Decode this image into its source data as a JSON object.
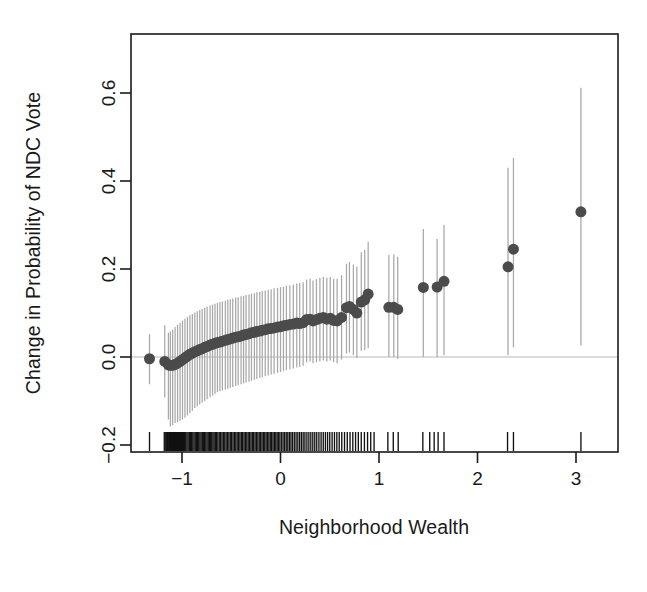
{
  "figure": {
    "background_color": "#ffffff",
    "point_color": "#4b4b4b",
    "errorbar_color": "#a8a8a8",
    "axis_color": "#1a1a1a",
    "zero_line_color": "#b9b9b9",
    "rug_color": "#111111"
  },
  "chart_data": {
    "type": "scatter",
    "title": "",
    "xlabel": "Neighborhood Wealth",
    "ylabel": "Change in Probability of NDC Vote",
    "xlim": [
      -1.5,
      3.4
    ],
    "ylim": [
      -0.28,
      0.72
    ],
    "grid": false,
    "legend": null,
    "xticks": [
      -1,
      0,
      1,
      2,
      3
    ],
    "xticklabels": [
      "−1",
      "0",
      "1",
      "2",
      "3"
    ],
    "yticks": [
      -0.2,
      0.0,
      0.2,
      0.4,
      0.6
    ],
    "yticklabels": [
      "−0.2",
      "0.0",
      "0.2",
      "0.4",
      "0.6"
    ],
    "reference_lines": [
      {
        "axis": "y",
        "value": 0.0,
        "style": "solid",
        "color": "#b9b9b9"
      }
    ],
    "annotations": [],
    "series": [
      {
        "name": "Marginal effect with 95% confidence interval",
        "marker": "filled-circle",
        "marker_size_px": 11,
        "has_errorbars": true,
        "points": [
          {
            "x": -1.33,
            "y": -0.004,
            "lo": -0.062,
            "hi": 0.052
          },
          {
            "x": -1.175,
            "y": -0.01,
            "lo": -0.092,
            "hi": 0.072
          },
          {
            "x": -1.138,
            "y": -0.018,
            "lo": -0.142,
            "hi": 0.055
          },
          {
            "x": -1.118,
            "y": -0.019,
            "lo": -0.158,
            "hi": 0.058
          },
          {
            "x": -1.095,
            "y": -0.019,
            "lo": -0.155,
            "hi": 0.062
          },
          {
            "x": -1.07,
            "y": -0.017,
            "lo": -0.15,
            "hi": 0.068
          },
          {
            "x": -1.045,
            "y": -0.014,
            "lo": -0.148,
            "hi": 0.073
          },
          {
            "x": -1.02,
            "y": -0.01,
            "lo": -0.145,
            "hi": 0.078
          },
          {
            "x": -0.995,
            "y": -0.006,
            "lo": -0.142,
            "hi": 0.083
          },
          {
            "x": -0.97,
            "y": -0.002,
            "lo": -0.138,
            "hi": 0.087
          },
          {
            "x": -0.945,
            "y": 0.002,
            "lo": -0.133,
            "hi": 0.091
          },
          {
            "x": -0.92,
            "y": 0.006,
            "lo": -0.128,
            "hi": 0.095
          },
          {
            "x": -0.895,
            "y": 0.009,
            "lo": -0.122,
            "hi": 0.098
          },
          {
            "x": -0.87,
            "y": 0.012,
            "lo": -0.116,
            "hi": 0.101
          },
          {
            "x": -0.845,
            "y": 0.014,
            "lo": -0.112,
            "hi": 0.104
          },
          {
            "x": -0.82,
            "y": 0.017,
            "lo": -0.108,
            "hi": 0.107
          },
          {
            "x": -0.795,
            "y": 0.019,
            "lo": -0.104,
            "hi": 0.109
          },
          {
            "x": -0.77,
            "y": 0.022,
            "lo": -0.1,
            "hi": 0.112
          },
          {
            "x": -0.745,
            "y": 0.024,
            "lo": -0.096,
            "hi": 0.114
          },
          {
            "x": -0.715,
            "y": 0.027,
            "lo": -0.092,
            "hi": 0.117
          },
          {
            "x": -0.69,
            "y": 0.029,
            "lo": -0.088,
            "hi": 0.119
          },
          {
            "x": -0.665,
            "y": 0.031,
            "lo": -0.084,
            "hi": 0.121
          },
          {
            "x": -0.64,
            "y": 0.033,
            "lo": -0.08,
            "hi": 0.123
          },
          {
            "x": -0.615,
            "y": 0.034,
            "lo": -0.078,
            "hi": 0.125
          },
          {
            "x": -0.59,
            "y": 0.036,
            "lo": -0.076,
            "hi": 0.126
          },
          {
            "x": -0.56,
            "y": 0.038,
            "lo": -0.074,
            "hi": 0.128
          },
          {
            "x": -0.535,
            "y": 0.04,
            "lo": -0.072,
            "hi": 0.13
          },
          {
            "x": -0.51,
            "y": 0.041,
            "lo": -0.07,
            "hi": 0.131
          },
          {
            "x": -0.485,
            "y": 0.043,
            "lo": -0.068,
            "hi": 0.133
          },
          {
            "x": -0.455,
            "y": 0.045,
            "lo": -0.066,
            "hi": 0.135
          },
          {
            "x": -0.43,
            "y": 0.046,
            "lo": -0.064,
            "hi": 0.136
          },
          {
            "x": -0.4,
            "y": 0.048,
            "lo": -0.062,
            "hi": 0.138
          },
          {
            "x": -0.375,
            "y": 0.05,
            "lo": -0.06,
            "hi": 0.139
          },
          {
            "x": -0.35,
            "y": 0.051,
            "lo": -0.058,
            "hi": 0.141
          },
          {
            "x": -0.32,
            "y": 0.053,
            "lo": -0.056,
            "hi": 0.142
          },
          {
            "x": -0.295,
            "y": 0.055,
            "lo": -0.054,
            "hi": 0.144
          },
          {
            "x": -0.265,
            "y": 0.056,
            "lo": -0.052,
            "hi": 0.145
          },
          {
            "x": -0.24,
            "y": 0.058,
            "lo": -0.05,
            "hi": 0.147
          },
          {
            "x": -0.21,
            "y": 0.059,
            "lo": -0.048,
            "hi": 0.148
          },
          {
            "x": -0.185,
            "y": 0.061,
            "lo": -0.046,
            "hi": 0.15
          },
          {
            "x": -0.155,
            "y": 0.062,
            "lo": -0.044,
            "hi": 0.151
          },
          {
            "x": -0.125,
            "y": 0.064,
            "lo": -0.042,
            "hi": 0.153
          },
          {
            "x": -0.095,
            "y": 0.065,
            "lo": -0.04,
            "hi": 0.154
          },
          {
            "x": -0.065,
            "y": 0.066,
            "lo": -0.038,
            "hi": 0.156
          },
          {
            "x": -0.03,
            "y": 0.068,
            "lo": -0.036,
            "hi": 0.157
          },
          {
            "x": 0.0,
            "y": 0.069,
            "lo": -0.034,
            "hi": 0.159
          },
          {
            "x": 0.03,
            "y": 0.071,
            "lo": -0.032,
            "hi": 0.16
          },
          {
            "x": 0.06,
            "y": 0.072,
            "lo": -0.03,
            "hi": 0.162
          },
          {
            "x": 0.095,
            "y": 0.074,
            "lo": -0.028,
            "hi": 0.163
          },
          {
            "x": 0.13,
            "y": 0.075,
            "lo": -0.026,
            "hi": 0.165
          },
          {
            "x": 0.165,
            "y": 0.077,
            "lo": -0.024,
            "hi": 0.167
          },
          {
            "x": 0.195,
            "y": 0.076,
            "lo": -0.022,
            "hi": 0.168
          },
          {
            "x": 0.23,
            "y": 0.078,
            "lo": -0.02,
            "hi": 0.17
          },
          {
            "x": 0.265,
            "y": 0.085,
            "lo": -0.012,
            "hi": 0.176
          },
          {
            "x": 0.3,
            "y": 0.086,
            "lo": -0.01,
            "hi": 0.178
          },
          {
            "x": 0.33,
            "y": 0.082,
            "lo": -0.014,
            "hi": 0.174
          },
          {
            "x": 0.365,
            "y": 0.085,
            "lo": -0.012,
            "hi": 0.177
          },
          {
            "x": 0.4,
            "y": 0.088,
            "lo": -0.01,
            "hi": 0.18
          },
          {
            "x": 0.435,
            "y": 0.09,
            "lo": -0.008,
            "hi": 0.182
          },
          {
            "x": 0.47,
            "y": 0.086,
            "lo": -0.01,
            "hi": 0.18
          },
          {
            "x": 0.505,
            "y": 0.088,
            "lo": -0.008,
            "hi": 0.182
          },
          {
            "x": 0.54,
            "y": 0.083,
            "lo": -0.012,
            "hi": 0.178
          },
          {
            "x": 0.575,
            "y": 0.082,
            "lo": -0.014,
            "hi": 0.178
          },
          {
            "x": 0.62,
            "y": 0.09,
            "lo": -0.006,
            "hi": 0.186
          },
          {
            "x": 0.67,
            "y": 0.112,
            "lo": 0.008,
            "hi": 0.212
          },
          {
            "x": 0.7,
            "y": 0.115,
            "lo": 0.01,
            "hi": 0.216
          },
          {
            "x": 0.74,
            "y": 0.108,
            "lo": 0.004,
            "hi": 0.21
          },
          {
            "x": 0.775,
            "y": 0.1,
            "lo": -0.002,
            "hi": 0.205
          },
          {
            "x": 0.82,
            "y": 0.125,
            "lo": 0.014,
            "hi": 0.238
          },
          {
            "x": 0.855,
            "y": 0.13,
            "lo": 0.016,
            "hi": 0.244
          },
          {
            "x": 0.89,
            "y": 0.143,
            "lo": 0.02,
            "hi": 0.262
          },
          {
            "x": 1.1,
            "y": 0.113,
            "lo": 0.0,
            "hi": 0.232
          },
          {
            "x": 1.15,
            "y": 0.113,
            "lo": 0.0,
            "hi": 0.233
          },
          {
            "x": 1.19,
            "y": 0.108,
            "lo": -0.004,
            "hi": 0.228
          },
          {
            "x": 1.45,
            "y": 0.158,
            "lo": 0.0,
            "hi": 0.291
          },
          {
            "x": 1.59,
            "y": 0.159,
            "lo": 0.0,
            "hi": 0.268
          },
          {
            "x": 1.66,
            "y": 0.172,
            "lo": 0.004,
            "hi": 0.3
          },
          {
            "x": 2.31,
            "y": 0.205,
            "lo": 0.004,
            "hi": 0.43
          },
          {
            "x": 2.365,
            "y": 0.245,
            "lo": 0.022,
            "hi": 0.452
          },
          {
            "x": 3.05,
            "y": 0.33,
            "lo": 0.026,
            "hi": 0.612
          }
        ]
      }
    ],
    "rug": {
      "name": "rug-plot-observations",
      "axis": "x",
      "position": "bottom",
      "values": [
        -1.33,
        -1.18,
        -1.165,
        -1.155,
        -1.148,
        -1.14,
        -1.132,
        -1.126,
        -1.118,
        -1.112,
        -1.106,
        -1.1,
        -1.094,
        -1.088,
        -1.082,
        -1.076,
        -1.07,
        -1.064,
        -1.058,
        -1.052,
        -1.046,
        -1.04,
        -1.034,
        -1.028,
        -1.022,
        -1.016,
        -1.01,
        -1.004,
        -0.998,
        -0.992,
        -0.986,
        -0.98,
        -0.974,
        -0.962,
        -0.95,
        -0.938,
        -0.926,
        -0.914,
        -0.902,
        -0.89,
        -0.878,
        -0.866,
        -0.854,
        -0.842,
        -0.83,
        -0.818,
        -0.806,
        -0.794,
        -0.782,
        -0.77,
        -0.758,
        -0.746,
        -0.734,
        -0.722,
        -0.71,
        -0.698,
        -0.686,
        -0.674,
        -0.662,
        -0.65,
        -0.636,
        -0.622,
        -0.608,
        -0.594,
        -0.58,
        -0.566,
        -0.552,
        -0.538,
        -0.524,
        -0.51,
        -0.496,
        -0.482,
        -0.468,
        -0.454,
        -0.44,
        -0.426,
        -0.412,
        -0.398,
        -0.384,
        -0.37,
        -0.356,
        -0.342,
        -0.328,
        -0.314,
        -0.3,
        -0.286,
        -0.272,
        -0.258,
        -0.244,
        -0.23,
        -0.216,
        -0.202,
        -0.188,
        -0.174,
        -0.16,
        -0.146,
        -0.132,
        -0.118,
        -0.104,
        -0.09,
        -0.076,
        -0.062,
        -0.048,
        -0.034,
        -0.02,
        -0.006,
        0.01,
        0.026,
        0.042,
        0.058,
        0.074,
        0.09,
        0.106,
        0.122,
        0.14,
        0.158,
        0.176,
        0.194,
        0.212,
        0.23,
        0.248,
        0.268,
        0.288,
        0.308,
        0.328,
        0.348,
        0.368,
        0.39,
        0.412,
        0.434,
        0.456,
        0.478,
        0.5,
        0.524,
        0.548,
        0.572,
        0.596,
        0.622,
        0.65,
        0.678,
        0.706,
        0.734,
        0.762,
        0.79,
        0.82,
        0.852,
        0.884,
        0.916,
        0.95,
        1.09,
        1.145,
        1.195,
        1.445,
        1.515,
        1.56,
        1.6,
        1.66,
        2.305,
        2.365,
        3.05
      ]
    }
  },
  "labels": {
    "x_axis_title": "Neighborhood Wealth",
    "y_axis_title": "Change in Probability of NDC Vote"
  }
}
